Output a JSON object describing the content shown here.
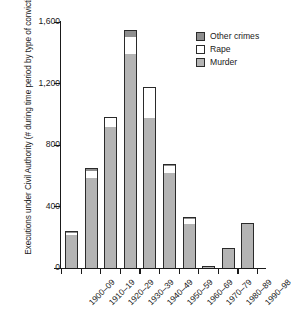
{
  "chart_data": {
    "type": "bar",
    "subtype": "stacked-bar",
    "title": "",
    "xlabel": "",
    "ylabel": "Executions under Civil Authority (# during time period by type of conviction)",
    "ylim": [
      0,
      1600
    ],
    "ytick_labels": [
      "1,600",
      "1,200",
      "800",
      "400",
      "0"
    ],
    "ytick_values": [
      1600,
      1200,
      800,
      400,
      0
    ],
    "grid": false,
    "legend_position": "top-right",
    "categories": [
      "1900–09",
      "1910–19",
      "1920–29",
      "1930–39",
      "1940–49",
      "1950–59",
      "1960–69",
      "1970–79",
      "1980–89",
      "1990–98"
    ],
    "series": [
      {
        "name": "Murder",
        "color": "#b4b4b4",
        "values": [
          215,
          585,
          920,
          1395,
          975,
          615,
          285,
          10,
          130,
          295
        ]
      },
      {
        "name": "Rape",
        "color": "#ffffff",
        "values": [
          5,
          45,
          55,
          110,
          195,
          50,
          35,
          0,
          0,
          0
        ]
      },
      {
        "name": "Other crimes",
        "color": "#8e8e8e",
        "values": [
          15,
          20,
          10,
          45,
          10,
          5,
          5,
          0,
          0,
          0
        ]
      }
    ],
    "totals": [
      235,
      650,
      985,
      1550,
      1180,
      670,
      325,
      10,
      130,
      295
    ]
  },
  "legend": {
    "items": [
      {
        "label": "Other crimes",
        "swatch": "swatch-other-crimes"
      },
      {
        "label": "Rape",
        "swatch": "swatch-rape"
      },
      {
        "label": "Murder",
        "swatch": "swatch-murder"
      }
    ]
  }
}
